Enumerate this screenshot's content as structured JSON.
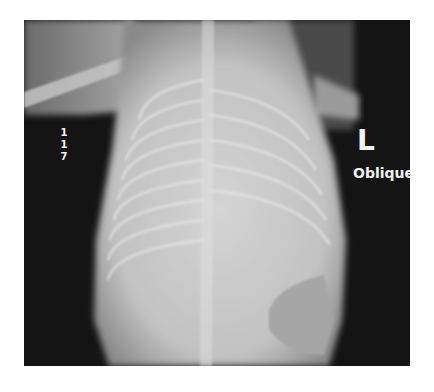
{
  "image": {
    "type": "radiograph",
    "description": "Infant chest/abdomen X-ray, oblique view",
    "background_color": "#141414",
    "frame_color": "#ffffff"
  },
  "annotations": {
    "series_number": "1",
    "image_number": "1 7",
    "side_marker": "L",
    "view_label": "Oblique"
  }
}
